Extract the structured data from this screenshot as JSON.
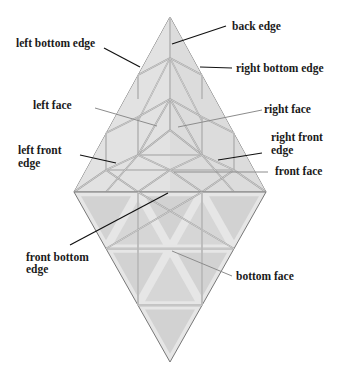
{
  "diagram": {
    "title": "",
    "labels": {
      "back_edge": "back edge",
      "left_bottom_edge": "left bottom edge",
      "right_bottom_edge": "right bottom edge",
      "left_face": "left face",
      "right_face": "right face",
      "left_front_edge_line1": "left front",
      "left_front_edge_line2": "edge",
      "right_front_edge_line1": "right front",
      "right_front_edge_line2": "edge",
      "front_face": "front face",
      "front_bottom_edge_line1": "front bottom",
      "front_bottom_edge_line2": "edge",
      "bottom_face": "bottom face"
    },
    "colors": {
      "background": "#ffffff",
      "piece_fill": "#d9d9d9",
      "sticker_fill": "#cfcfcf",
      "label_text": "#1a1a1a"
    }
  }
}
